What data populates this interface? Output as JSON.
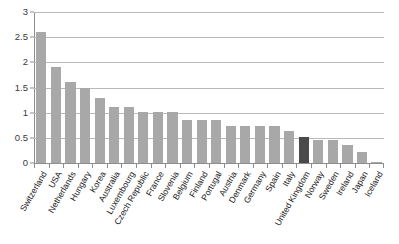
{
  "chart_data": {
    "type": "bar",
    "title": "",
    "subtitle": "",
    "xlabel": "",
    "ylabel": "",
    "ylim": [
      0,
      3
    ],
    "yticks": [
      0,
      0.5,
      1,
      1.5,
      2,
      2.5,
      3
    ],
    "ytick_labels": [
      "0",
      "0.5",
      "1",
      "1.5",
      "2",
      "2.5",
      "3"
    ],
    "grid": true,
    "legend": "none",
    "orientation": "vertical",
    "categories": [
      "Switzerland",
      "USA",
      "Netherlands",
      "Hungary",
      "Korea",
      "Australia",
      "Luxembourg",
      "Czech Republic",
      "France",
      "Slovenia",
      "Belgium",
      "Finland",
      "Portugal",
      "Austria",
      "Denmark",
      "Germany",
      "Spain",
      "Italy",
      "United Kingdom",
      "Norway",
      "Sweden",
      "Ireland",
      "Japan",
      "Iceland"
    ],
    "values": [
      2.6,
      1.9,
      1.6,
      1.5,
      1.3,
      1.12,
      1.12,
      1.02,
      1.02,
      1.02,
      0.85,
      0.85,
      0.85,
      0.73,
      0.73,
      0.73,
      0.73,
      0.63,
      0.52,
      0.45,
      0.45,
      0.35,
      0.22,
      0.02
    ],
    "highlighted_category": "United Kingdom",
    "colors": {
      "bar": "#a8a8a8",
      "bar_highlight": "#4a4a4a",
      "gridline": "#b9b9b9",
      "axis": "#8d8d8d",
      "text": "#1c1c1c",
      "background": "#ffffff"
    }
  }
}
